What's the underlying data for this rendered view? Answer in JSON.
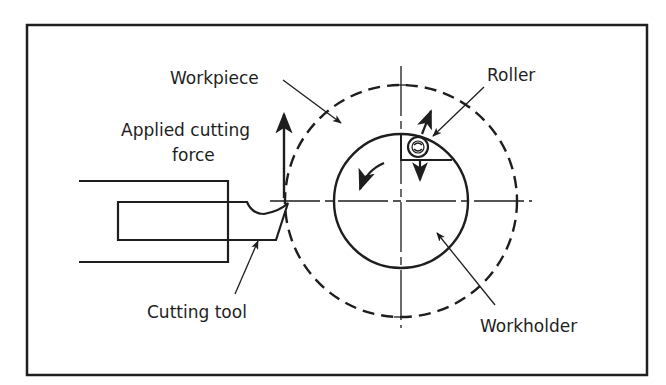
{
  "diagram": {
    "labels": {
      "workpiece": "Workpiece",
      "applied_force_line1": "Applied cutting",
      "applied_force_line2": "force",
      "roller": "Roller",
      "cutting_tool": "Cutting tool",
      "workholder": "Workholder"
    },
    "colors": {
      "ink": "#1e1e1e",
      "background": "#ffffff"
    }
  }
}
